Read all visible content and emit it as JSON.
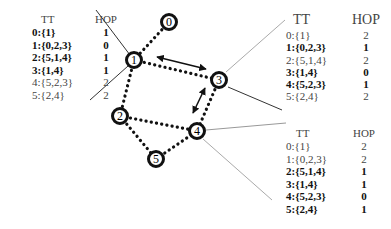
{
  "diagram": {
    "nodes": [
      {
        "id": "0",
        "x": 169,
        "y": 22
      },
      {
        "id": "1",
        "x": 134,
        "y": 60
      },
      {
        "id": "2",
        "x": 120,
        "y": 116
      },
      {
        "id": "3",
        "x": 219,
        "y": 80
      },
      {
        "id": "4",
        "x": 197,
        "y": 131
      },
      {
        "id": "5",
        "x": 156,
        "y": 159
      }
    ],
    "dotted_edges": [
      [
        "0",
        "1"
      ],
      [
        "1",
        "3"
      ],
      [
        "1",
        "2"
      ],
      [
        "3",
        "4"
      ],
      [
        "2",
        "4"
      ],
      [
        "2",
        "5"
      ],
      [
        "5",
        "4"
      ]
    ],
    "double_arrows": [
      [
        "1",
        "3"
      ],
      [
        "3",
        "4"
      ]
    ]
  },
  "tables": {
    "node1": {
      "header": {
        "tt": "TT",
        "hop": "HOP"
      },
      "rows": [
        {
          "tt": "0:{1}",
          "hop": "1",
          "bold": true
        },
        {
          "tt": "1:{0,2,3}",
          "hop": "0",
          "bold": true
        },
        {
          "tt": "2:{5,1,4}",
          "hop": "1",
          "bold": true
        },
        {
          "tt": "3:{1,4}",
          "hop": "1",
          "bold": true
        },
        {
          "tt": "4:{5,2,3}",
          "hop": "2",
          "bold": false
        },
        {
          "tt": "5:{2,4}",
          "hop": "2",
          "bold": false
        }
      ]
    },
    "node3": {
      "header": {
        "tt": "TT",
        "hop": "HOP"
      },
      "rows": [
        {
          "tt": "0:{1}",
          "hop": "2",
          "bold": false
        },
        {
          "tt": "1:{0,2,3}",
          "hop": "1",
          "bold": true
        },
        {
          "tt": "2:{5,1,4}",
          "hop": "2",
          "bold": false
        },
        {
          "tt": "3:{1,4}",
          "hop": "0",
          "bold": true
        },
        {
          "tt": "4:{5,2,3}",
          "hop": "1",
          "bold": true
        },
        {
          "tt": "5:{2,4}",
          "hop": "2",
          "bold": false
        }
      ]
    },
    "node4": {
      "header": {
        "tt": "TT",
        "hop": "HOP"
      },
      "rows": [
        {
          "tt": "0:{1}",
          "hop": "2",
          "bold": false
        },
        {
          "tt": "1:{0,2,3}",
          "hop": "2",
          "bold": false
        },
        {
          "tt": "2:{5,1,4}",
          "hop": "1",
          "bold": true
        },
        {
          "tt": "3:{1,4}",
          "hop": "1",
          "bold": true
        },
        {
          "tt": "4:{5,2,3}",
          "hop": "0",
          "bold": true
        },
        {
          "tt": "5:{2,4}",
          "hop": "1",
          "bold": true
        }
      ]
    }
  }
}
